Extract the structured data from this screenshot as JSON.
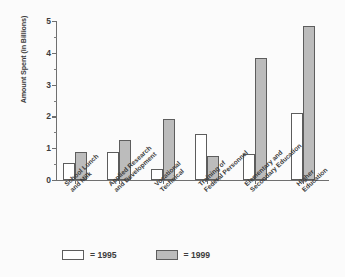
{
  "chart_data": {
    "type": "bar",
    "title": "",
    "xlabel": "",
    "ylabel": "Amount Spent (in Billions)",
    "ylim": [
      0,
      5
    ],
    "ytick_labels": [
      "0",
      "1",
      "2",
      "3",
      "4",
      "5"
    ],
    "yticks": [
      0,
      1,
      2,
      3,
      4,
      5
    ],
    "minor_ticks": [
      0.5,
      1.5,
      2.5,
      3.5,
      4.5
    ],
    "grid": false,
    "legend_position": "bottom-left",
    "categories": [
      "School Lunch and Milk",
      "Applied Research and Development",
      "Vocational Technical",
      "Training of Federal Personnel",
      "Elementary and Secondary Education",
      "Higher Education"
    ],
    "category_lines": [
      [
        "School Lunch",
        "and Milk"
      ],
      [
        "Applied Research",
        "and Development"
      ],
      [
        "Vocational",
        "Technical"
      ],
      [
        "Training of",
        "Federal Personnel"
      ],
      [
        "Elementary and",
        "Secondary Education"
      ],
      [
        "Higher",
        "Education"
      ]
    ],
    "series": [
      {
        "name": "1995",
        "color": "#ffffff",
        "values": [
          0.55,
          0.88,
          0.35,
          1.45,
          0.82,
          2.1
        ]
      },
      {
        "name": "1999",
        "color": "#bcbcbc",
        "values": [
          0.87,
          1.27,
          1.92,
          0.75,
          3.85,
          4.85
        ]
      }
    ]
  },
  "legend": {
    "items": [
      {
        "label": "= 1995",
        "swatch": "white"
      },
      {
        "label": "= 1999",
        "swatch": "gray"
      }
    ]
  }
}
